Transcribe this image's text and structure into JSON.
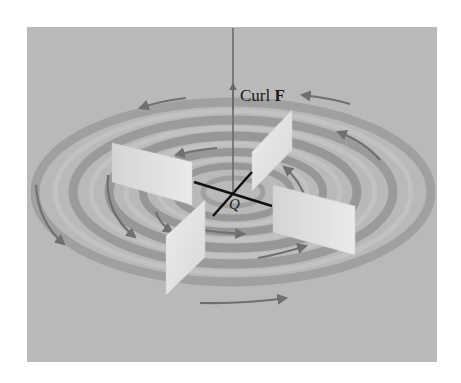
{
  "figure": {
    "curl_label_text": "Curl",
    "curl_label_bold": "F",
    "point_label": "Q",
    "colors": {
      "background_panel": "#b9b9b9",
      "ring_dark": "#8e8e8e",
      "ring_light": "#c8c8c8",
      "arrow": "#707070",
      "paddle": "#e4e4e4",
      "axis_line": "#111111",
      "curl_vector": "#6a6a6a"
    }
  }
}
